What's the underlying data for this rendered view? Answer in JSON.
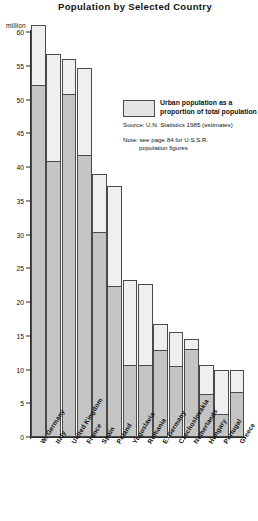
{
  "title": "Population by Selected Country",
  "unit_label": "million",
  "legend": {
    "swatch_name": "urban-population-swatch",
    "line1": "Urban population as a",
    "line2": "proportion of total population"
  },
  "source": "Source: U.N. Statistics 1985 (estimates)",
  "note_line1": "Note: see page 84 for U.S.S.R.",
  "note_line2": "population figures",
  "colors": {
    "total_fill": "#efefef",
    "urban_fill": "#c4c4c4",
    "outline": "#4a4a4a",
    "axis": "#2b2b2b",
    "text": "#111111"
  },
  "chart_data": {
    "type": "bar",
    "subtype": "stacked",
    "title": "Population by Selected Country",
    "xlabel": "",
    "ylabel": "million",
    "ylim": [
      0,
      60
    ],
    "yticks": [
      0,
      5,
      10,
      15,
      20,
      25,
      30,
      35,
      40,
      45,
      50,
      55,
      60
    ],
    "grid": false,
    "legend_position": "upper-right-inset",
    "categories": [
      "W. Germany",
      "Italy",
      "United Kingdom",
      "France",
      "Spain",
      "Poland",
      "Yugoslavia",
      "Romania",
      "E. Germany",
      "Czechoslovakia",
      "Netherlands",
      "Hungary",
      "Portugal",
      "Greece"
    ],
    "series": [
      {
        "name": "Total population",
        "values": [
          61.0,
          56.7,
          56.0,
          54.6,
          38.9,
          37.2,
          23.2,
          22.7,
          16.7,
          15.5,
          14.5,
          10.6,
          10.0,
          10.0
        ]
      },
      {
        "name": "Urban population as a proportion of total population",
        "values": [
          52.0,
          40.7,
          50.7,
          41.6,
          30.2,
          22.2,
          10.5,
          10.5,
          12.7,
          10.3,
          12.9,
          6.2,
          3.3,
          6.5
        ]
      }
    ],
    "annotations": [
      "Source: U.N. Statistics 1985 (estimates)",
      "Note: see page 84 for U.S.S.R. population figures"
    ]
  }
}
